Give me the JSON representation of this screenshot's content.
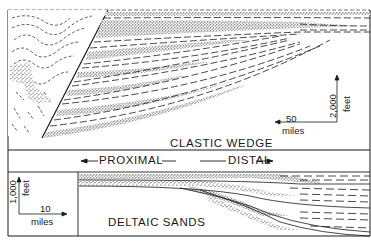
{
  "figure": {
    "type": "geologic cross-section diagram",
    "panels": [
      {
        "id": "top",
        "title": "CLASTIC WEDGE",
        "scale": {
          "vertical_value": "2,000",
          "vertical_unit": "feet",
          "horizontal_value": "50",
          "horizontal_unit": "miles"
        }
      },
      {
        "id": "bottom",
        "title": "DELTAIC SANDS",
        "scale": {
          "vertical_value": "1,000",
          "vertical_unit": "feet",
          "horizontal_value": "10",
          "horizontal_unit": "miles"
        }
      }
    ],
    "direction_labels": {
      "proximal": "PROXIMAL",
      "distal": "DISTAL"
    },
    "colors": {
      "ink": "#1a1a1a",
      "paper": "#ffffff"
    }
  }
}
